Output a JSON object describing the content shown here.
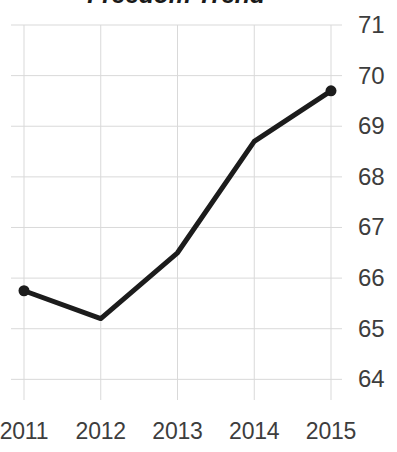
{
  "chart_data": {
    "type": "line",
    "title": "Freedom Trend",
    "xlabel": "",
    "ylabel": "",
    "categories": [
      "2011",
      "2012",
      "2013",
      "2014",
      "2015"
    ],
    "x": [
      2011,
      2012,
      2013,
      2014,
      2015
    ],
    "values": [
      65.75,
      65.2,
      66.5,
      68.7,
      69.7
    ],
    "series": [
      {
        "name": "Freedom Trend",
        "values": [
          65.75,
          65.2,
          66.5,
          68.7,
          69.7
        ]
      }
    ],
    "ylim": [
      63.75,
      71.0
    ],
    "y_ticks": [
      71,
      70,
      69,
      68,
      67,
      66,
      65,
      64
    ],
    "y_tick_labels": [
      "71",
      "70",
      "69",
      "68",
      "67",
      "66",
      "65",
      "64"
    ],
    "x_tick_labels": [
      "2011",
      "2012",
      "2013",
      "2014",
      "2015"
    ],
    "grid": true,
    "y_axis_position": "right",
    "legend": "none",
    "line_color": "#1c1c1c",
    "marker_color": "#1c1c1c",
    "grid_color": "#d9d9d9",
    "tick_label_color": "#3d3d3d",
    "title_color": "#1a1a1a",
    "background_color": "#ffffff"
  }
}
